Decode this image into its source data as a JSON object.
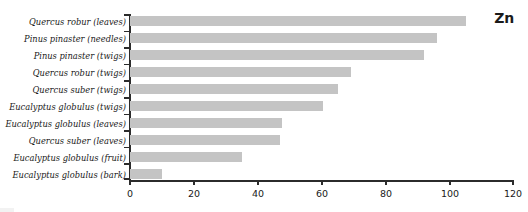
{
  "chart_data": {
    "type": "bar",
    "orientation": "horizontal",
    "title": "Zn",
    "xlabel": "",
    "ylabel": "",
    "xlim": [
      0,
      120
    ],
    "xticks": [
      0,
      20,
      40,
      60,
      80,
      100,
      120
    ],
    "xtick_labels": [
      "0",
      "20",
      "40",
      "60",
      "80",
      "100",
      "120"
    ],
    "grid": false,
    "legend": null,
    "bar_color": "#c4c4c4",
    "axis_color": "#2b2b2b",
    "categories": [
      "Quercus robur (leaves)",
      "Pinus pinaster (needles)",
      "Pinus pinaster (twigs)",
      "Quercus robur (twigs)",
      "Quercus suber (twigs)",
      "Eucalyptus globulus (twigs)",
      "Eucalyptus globulus (leaves)",
      "Quercus suber (leaves)",
      "Eucalyptus globulus (fruit)",
      "Eucalyptus globulus (bark)"
    ],
    "values": [
      105,
      96,
      92,
      69,
      65,
      60.5,
      47.5,
      47,
      35,
      10
    ]
  }
}
